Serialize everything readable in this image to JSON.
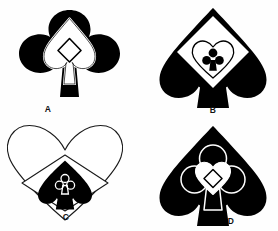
{
  "figure": {
    "background_color": "#ffffff",
    "ink_color": "#000000",
    "paper_color": "#ffffff",
    "panel_count": 4,
    "panels": [
      {
        "id": "A",
        "label": "A",
        "outer_shape": "club",
        "outer_fill": "black",
        "nesting": [
          "club",
          "spade",
          "diamond"
        ],
        "shapes": [
          {
            "name": "club",
            "fill": "black",
            "stroke": "none",
            "role": "outer"
          },
          {
            "name": "spade",
            "fill": "white",
            "stroke": "white",
            "role": "middle"
          },
          {
            "name": "diamond",
            "fill": "white",
            "stroke": "black",
            "role": "inner"
          }
        ]
      },
      {
        "id": "B",
        "label": "B",
        "outer_shape": "spade",
        "outer_fill": "black",
        "nesting": [
          "spade",
          "diamond",
          "heart",
          "club"
        ],
        "shapes": [
          {
            "name": "spade",
            "fill": "black",
            "stroke": "none",
            "role": "outer"
          },
          {
            "name": "diamond",
            "fill": "white",
            "stroke": "none",
            "role": "middle"
          },
          {
            "name": "heart",
            "fill": "white",
            "stroke": "black",
            "role": "inner"
          },
          {
            "name": "club",
            "fill": "black",
            "stroke": "none",
            "role": "innermost"
          }
        ]
      },
      {
        "id": "C",
        "label": "C",
        "outer_shape": "heart",
        "outer_fill": "white",
        "nesting": [
          "heart",
          "diamond",
          "spade",
          "club"
        ],
        "shapes": [
          {
            "name": "heart",
            "fill": "white",
            "stroke": "black",
            "role": "outer"
          },
          {
            "name": "diamond",
            "fill": "white",
            "stroke": "black",
            "role": "middle"
          },
          {
            "name": "spade",
            "fill": "black",
            "stroke": "none",
            "role": "inner"
          },
          {
            "name": "club",
            "fill": "none",
            "stroke": "white",
            "role": "innermost"
          }
        ]
      },
      {
        "id": "D",
        "label": "D",
        "outer_shape": "spade",
        "outer_fill": "black",
        "nesting": [
          "spade",
          "club",
          "heart",
          "diamond"
        ],
        "shapes": [
          {
            "name": "spade",
            "fill": "black",
            "stroke": "none",
            "role": "outer"
          },
          {
            "name": "club",
            "fill": "none",
            "stroke": "white",
            "role": "middle"
          },
          {
            "name": "heart",
            "fill": "white",
            "stroke": "white",
            "role": "inner"
          },
          {
            "name": "diamond",
            "fill": "none",
            "stroke": "black",
            "role": "innermost"
          }
        ]
      }
    ]
  }
}
